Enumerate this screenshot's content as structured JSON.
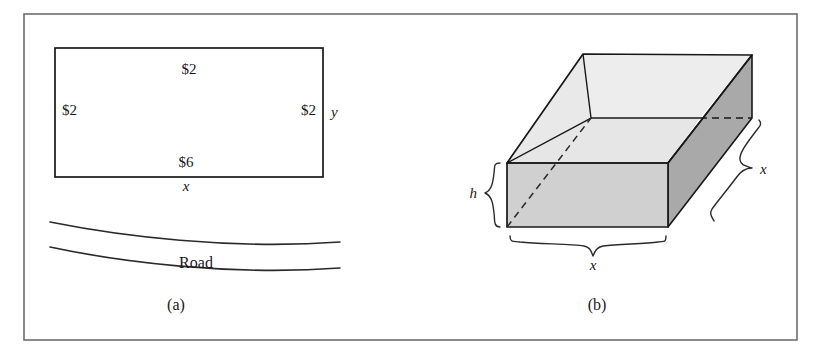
{
  "figure": {
    "panels": [
      {
        "id": "panel-a",
        "caption": "(a)",
        "kind": "plan-view-rectangle-with-road",
        "rectangle": {
          "labels": {
            "top": "$2",
            "left": "$2",
            "right": "$2",
            "bottom": "$6",
            "width_var": "x",
            "height_var": "y"
          }
        },
        "road": {
          "label": "Road",
          "lines": 2
        }
      },
      {
        "id": "panel-b",
        "caption": "(b)",
        "kind": "open-top-rectangular-box-3d",
        "dimensions": {
          "height": "h",
          "width": "x",
          "depth": "x"
        }
      }
    ],
    "colors": {
      "stroke": "#18181a",
      "frame": "#6d6d70",
      "face_top_inner": "#ededee",
      "face_front": "#d0d0d0",
      "face_right_dark": "#a9a9aa",
      "face_inner_wall": "#e3e3e4",
      "background": "#ffffff"
    }
  }
}
